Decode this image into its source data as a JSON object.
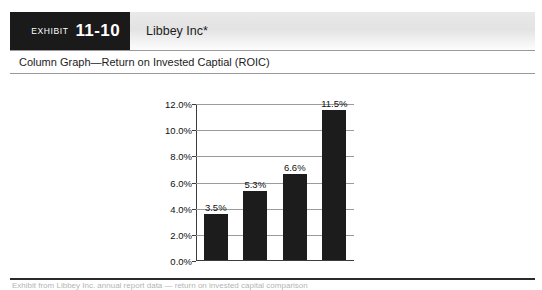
{
  "exhibit": {
    "label": "EXHIBIT",
    "number": "11-10",
    "company": "Libbey Inc*",
    "subtitle": "Column Graph—Return on Invested Captial (ROIC)",
    "footnote": "Exhibit from Libbey Inc. annual report data — return on invested capital comparison"
  },
  "colors": {
    "bar": "#1c1c1c",
    "tab_background": "#1a1a1a",
    "gridline": "#9b9b9b",
    "frame": "#8d8d8d"
  },
  "chart_data": {
    "type": "bar",
    "title": "Column Graph—Return on Invested Captial (ROIC)",
    "xlabel": "",
    "ylabel": "",
    "categories": [
      "2005",
      "2008",
      "2009",
      "2010"
    ],
    "values": [
      3.5,
      5.3,
      6.6,
      11.5
    ],
    "value_labels": [
      "3.5%",
      "5.3%",
      "6.6%",
      "11.5%"
    ],
    "ylim": [
      0,
      12
    ],
    "yticks": [
      0,
      2,
      4,
      6,
      8,
      10,
      12
    ],
    "ytick_labels": [
      "0.0%",
      "2.0%",
      "4.0%",
      "6.0%",
      "8.0%",
      "10.0%",
      "12.0%"
    ],
    "grid": true,
    "legend": false
  }
}
